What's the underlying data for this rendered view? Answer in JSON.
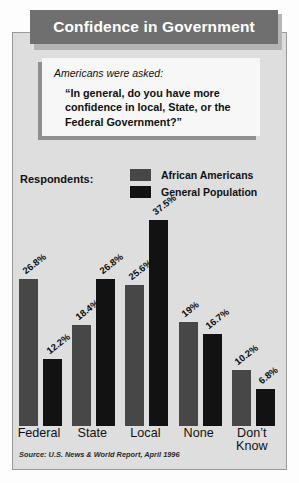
{
  "title": "Confidence in Government",
  "question": {
    "intro": "Americans were asked:",
    "text": "“In general, do you have more confidence in local, State, or the Federal Government?”"
  },
  "legend": {
    "respondents_label": "Respondents:",
    "entries": [
      {
        "label": "African Americans",
        "color": "#474747"
      },
      {
        "label": "General Population",
        "color": "#121212"
      }
    ]
  },
  "source": "Source: U.S. News & World Report, April 1996",
  "chart_data": {
    "type": "bar",
    "title": "Confidence in Government",
    "categories": [
      "Federal",
      "State",
      "Local",
      "None",
      "Don’t Know"
    ],
    "series": [
      {
        "name": "African Americans",
        "color": "#474747",
        "values": [
          26.8,
          18.4,
          25.6,
          19,
          10.2
        ],
        "labels": [
          "26.8%",
          "18.4%",
          "25.6%",
          "19%",
          "10.2%"
        ]
      },
      {
        "name": "General Population",
        "color": "#121212",
        "values": [
          12.2,
          26.8,
          37.5,
          16.7,
          6.8
        ],
        "labels": [
          "12.2%",
          "26.8%",
          "37.5%",
          "16.7%",
          "6.8%"
        ]
      }
    ],
    "xlabel": "",
    "ylabel": "",
    "ylim": [
      0,
      40
    ],
    "grid": false,
    "legend_position": "top",
    "value_labels": true,
    "value_label_rotation": -38
  }
}
